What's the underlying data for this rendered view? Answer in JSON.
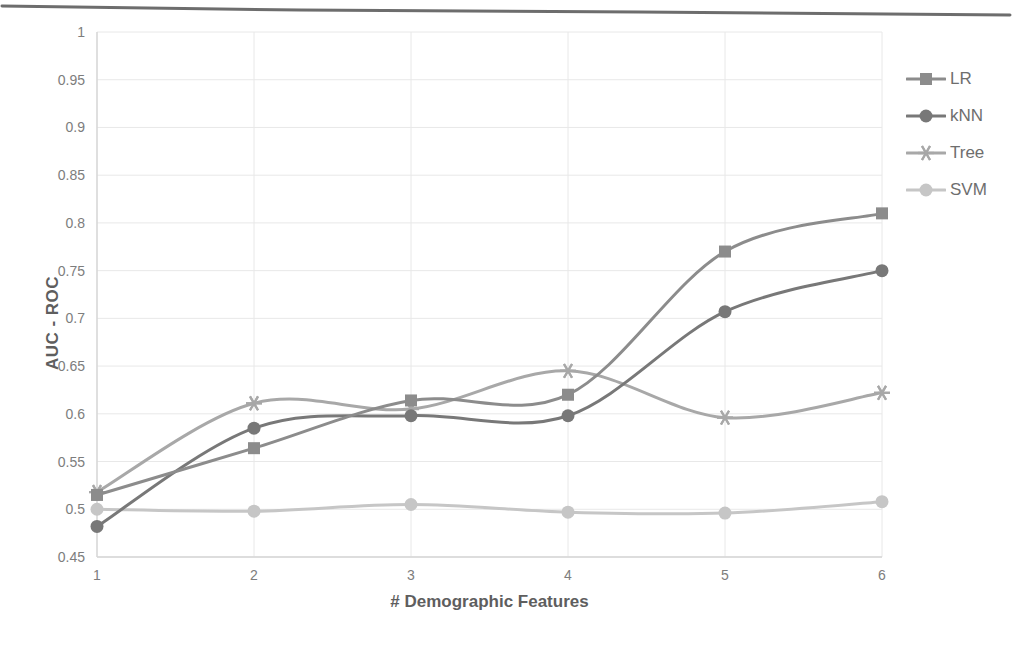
{
  "chart_data": {
    "type": "line",
    "title": "",
    "xlabel": "# Demographic Features",
    "ylabel": "AUC - ROC",
    "x": [
      1,
      2,
      3,
      4,
      5,
      6
    ],
    "categories": [
      "1",
      "2",
      "3",
      "4",
      "5",
      "6"
    ],
    "xtick_labels": [
      "1",
      "2",
      "3",
      "4",
      "5",
      "6"
    ],
    "ytick_labels": [
      "0.45",
      "0.5",
      "0.55",
      "0.6",
      "0.65",
      "0.7",
      "0.75",
      "0.8",
      "0.85",
      "0.9",
      "0.95",
      "1"
    ],
    "ytick_values": [
      0.45,
      0.5,
      0.55,
      0.6,
      0.65,
      0.7,
      0.75,
      0.8,
      0.85,
      0.9,
      0.95,
      1
    ],
    "ylim": [
      0.45,
      1
    ],
    "xlim": [
      1,
      6
    ],
    "grid": true,
    "legend_position": "right",
    "series": [
      {
        "name": "LR",
        "marker": "square",
        "color": "#8c8c8c",
        "values": [
          0.515,
          0.564,
          0.614,
          0.62,
          0.77,
          0.81
        ]
      },
      {
        "name": "kNN",
        "marker": "circle",
        "color": "#787878",
        "values": [
          0.482,
          0.585,
          0.598,
          0.598,
          0.707,
          0.75
        ]
      },
      {
        "name": "Tree",
        "marker": "asterisk",
        "color": "#a8a8a8",
        "values": [
          0.518,
          0.611,
          0.605,
          0.645,
          0.596,
          0.622
        ]
      },
      {
        "name": "SVM",
        "marker": "circle",
        "color": "#c6c6c6",
        "values": [
          0.5,
          0.498,
          0.505,
          0.497,
          0.496,
          0.508
        ]
      }
    ]
  },
  "colors": {
    "background": "#ffffff",
    "grid": "#e8e8e8",
    "axis": "#d6d6d6",
    "tick_text": "#7d7d7d",
    "label_text": "#5e5e5e"
  }
}
